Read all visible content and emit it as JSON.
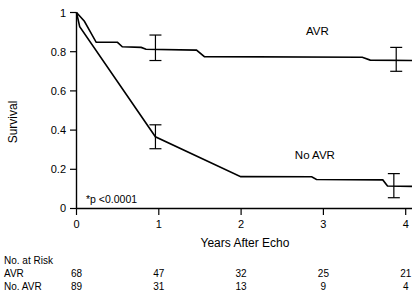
{
  "chart_data": {
    "type": "line",
    "title": "",
    "subtitle": "",
    "xlabel": "Years After Echo",
    "ylabel": "Survival",
    "xlim": [
      0,
      4.25
    ],
    "ylim": [
      0,
      1
    ],
    "xticks": [
      "0",
      "1",
      "2",
      "3",
      "4"
    ],
    "xtick_values": [
      0,
      1,
      2,
      3,
      4
    ],
    "yticks": [
      "0",
      "0.2",
      "0.4",
      "0.6",
      "0.8",
      "1"
    ],
    "ytick_values": [
      0,
      0.2,
      0.4,
      0.6,
      0.8,
      1
    ],
    "grid": false,
    "legend_position": "inline-annotation",
    "annotation": "*p <0.0001",
    "series": [
      {
        "name": "AVR",
        "label": "AVR",
        "label_x": 3.05,
        "label_y": 0.885,
        "step_points": [
          [
            0.0,
            1.0
          ],
          [
            0.1,
            0.955
          ],
          [
            0.25,
            0.848
          ],
          [
            0.52,
            0.848
          ],
          [
            0.58,
            0.825
          ],
          [
            0.82,
            0.822
          ],
          [
            0.88,
            0.812
          ],
          [
            1.52,
            0.808
          ],
          [
            1.62,
            0.775
          ],
          [
            3.62,
            0.772
          ],
          [
            3.72,
            0.757
          ],
          [
            4.25,
            0.755
          ]
        ],
        "error_bars": [
          {
            "x": 1.0,
            "y": 0.812,
            "low": 0.755,
            "high": 0.885
          },
          {
            "x": 4.05,
            "y": 0.757,
            "low": 0.7,
            "high": 0.822
          }
        ]
      },
      {
        "name": "No AVR",
        "label": "No AVR",
        "label_x": 3.02,
        "label_y": 0.255,
        "step_points": [
          [
            0.0,
            1.0
          ],
          [
            0.04,
            0.928
          ],
          [
            1.0,
            0.366
          ],
          [
            2.08,
            0.163
          ],
          [
            2.98,
            0.162
          ],
          [
            3.04,
            0.148
          ],
          [
            3.88,
            0.146
          ],
          [
            3.94,
            0.115
          ],
          [
            4.25,
            0.113
          ]
        ],
        "error_bars": [
          {
            "x": 1.0,
            "y": 0.366,
            "low": 0.305,
            "high": 0.427
          },
          {
            "x": 4.02,
            "y": 0.115,
            "low": 0.055,
            "high": 0.178
          }
        ]
      }
    ]
  },
  "risk_table": {
    "title": "No. at Risk",
    "rows": [
      {
        "label": "AVR",
        "values": [
          "68",
          "47",
          "32",
          "25",
          "21"
        ]
      },
      {
        "label": "No. AVR",
        "values": [
          "89",
          "31",
          "13",
          "9",
          "4"
        ]
      }
    ]
  },
  "axis": {
    "ylabel": "Survival",
    "xlabel": "Years After Echo"
  },
  "annotation": {
    "pvalue": "*p <0.0001"
  },
  "colors": {
    "line": "#000000",
    "background": "#ffffff",
    "text": "#000000"
  }
}
